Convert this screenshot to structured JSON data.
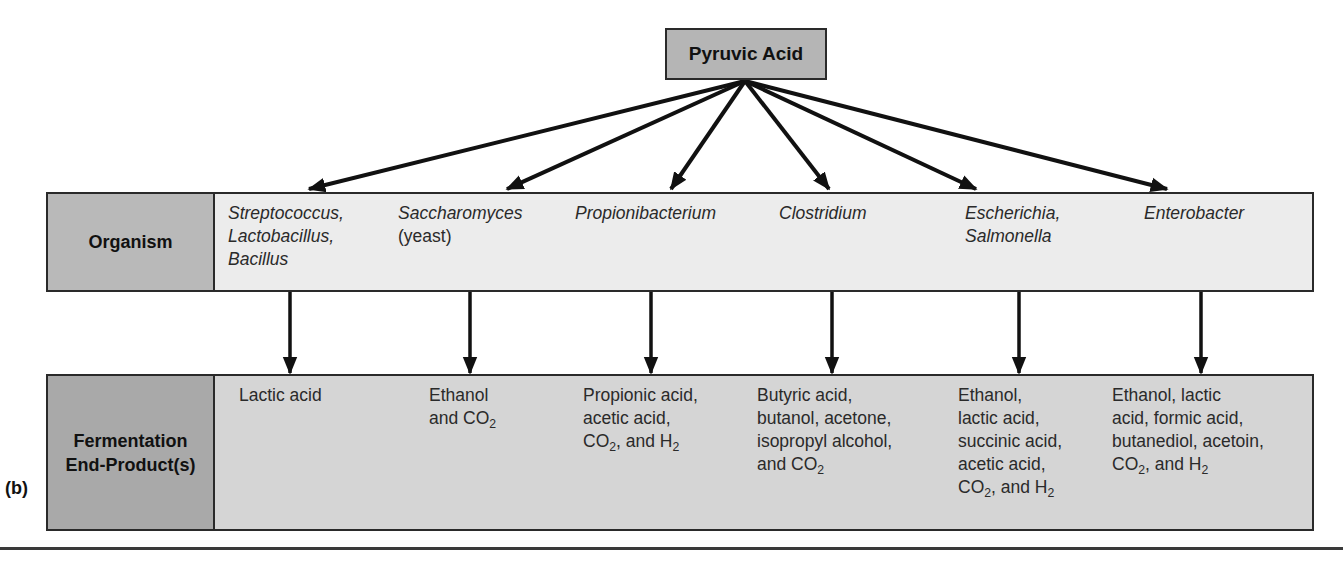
{
  "figure": {
    "panel_label": "(b)",
    "source": {
      "label": "Pyruvic Acid"
    },
    "rows": {
      "organism": {
        "header": "Organism"
      },
      "products": {
        "header_line1": "Fermentation",
        "header_line2": "End-Product(s)"
      }
    },
    "columns": [
      {
        "organism_lines": [
          "Streptococcus,",
          "Lactobacillus,",
          "Bacillus"
        ],
        "product_lines": [
          "Lactic acid"
        ]
      },
      {
        "organism_lines": [
          "Saccharomyces"
        ],
        "organism_note": "(yeast)",
        "product_lines": [
          "Ethanol",
          "and CO|2|"
        ]
      },
      {
        "organism_lines": [
          "Propionibacterium"
        ],
        "product_lines": [
          "Propionic acid,",
          "acetic acid,",
          "CO|2|, and H|2|"
        ]
      },
      {
        "organism_lines": [
          "Clostridium"
        ],
        "product_lines": [
          "Butyric acid,",
          "butanol, acetone,",
          "isopropyl alcohol,",
          "and CO|2|"
        ]
      },
      {
        "organism_lines": [
          "Escherichia,",
          "Salmonella"
        ],
        "product_lines": [
          "Ethanol,",
          "lactic acid,",
          "succinic acid,",
          "acetic acid,",
          "CO|2|, and H|2|"
        ]
      },
      {
        "organism_lines": [
          "Enterobacter"
        ],
        "product_lines": [
          "Ethanol, lactic",
          "acid, formic acid,",
          "butanediol, acetoin,",
          "CO|2|, and H|2|"
        ]
      }
    ],
    "colors": {
      "source_fill": "#b5b5b5",
      "organism_header_fill": "#b9b9b9",
      "organism_row_fill": "#ececec",
      "products_header_fill": "#a9a9a9",
      "products_row_fill": "#d5d5d5",
      "stroke": "#111111"
    }
  }
}
